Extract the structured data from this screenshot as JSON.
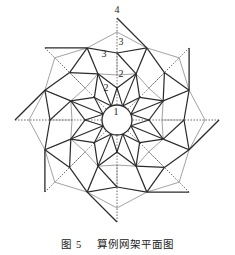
{
  "figure": {
    "caption_number": "图 5",
    "caption_title": "算例网架平面图",
    "labels": [
      {
        "text": "4",
        "x": 117,
        "y": 13
      },
      {
        "text": "3",
        "x": 121,
        "y": 45
      },
      {
        "text": "3",
        "x": 104,
        "y": 57
      },
      {
        "text": "2",
        "x": 121,
        "y": 77
      },
      {
        "text": "2",
        "x": 106,
        "y": 91
      },
      {
        "text": "1",
        "x": 116,
        "y": 115
      }
    ],
    "geometry": {
      "center": [
        117,
        120
      ],
      "outer_tip_r": 102,
      "outer_notch_r": 78,
      "ring3_axis_r": 67,
      "ring3_gray_r": 88,
      "ring2_axis_r": 32,
      "ring2_mid_r": 50,
      "ring2_gray_r": 45,
      "hub_r": 15
    },
    "colors": {
      "main_member": "#2a2a2a",
      "secondary_member": "#8a8a8a",
      "dashed_member": "#555555"
    }
  }
}
